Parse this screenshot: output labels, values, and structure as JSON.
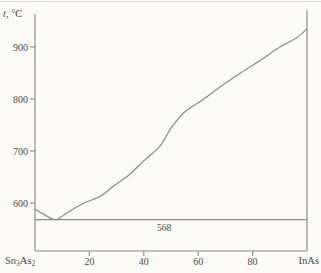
{
  "figure": {
    "background": "#fcfbf7",
    "line_color": "#8a8a86",
    "faint_line_color": "#d9d8d2",
    "text_color": "#4d4944"
  },
  "chart_data": {
    "type": "line",
    "title": "",
    "y_axis": {
      "label_var": "t",
      "label_rest": ", °C",
      "ticks": [
        900,
        800,
        700,
        600
      ],
      "range": [
        508,
        970
      ]
    },
    "x_axis": {
      "left_label_parts": [
        "Sn",
        "3",
        "As",
        "2"
      ],
      "right_label": "InAs",
      "ticks": [
        20,
        40,
        60,
        80
      ],
      "range": [
        0,
        100
      ]
    },
    "eutectic": {
      "temperature": 568,
      "label": "568"
    },
    "series": [
      {
        "name": "liquidus",
        "points_pct_degC": [
          [
            0,
            588
          ],
          [
            3,
            579
          ],
          [
            6,
            570
          ],
          [
            8,
            568
          ],
          [
            10,
            575
          ],
          [
            13,
            585
          ],
          [
            18,
            600
          ],
          [
            24,
            613
          ],
          [
            29,
            633
          ],
          [
            35,
            656
          ],
          [
            40,
            681
          ],
          [
            46,
            710
          ],
          [
            50,
            744
          ],
          [
            55,
            775
          ],
          [
            61,
            796
          ],
          [
            68,
            823
          ],
          [
            75,
            848
          ],
          [
            83,
            875
          ],
          [
            90,
            900
          ],
          [
            96,
            917
          ],
          [
            100,
            935
          ]
        ]
      }
    ]
  }
}
